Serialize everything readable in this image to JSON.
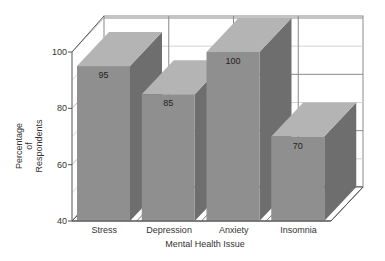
{
  "chart_data": {
    "type": "bar",
    "style": "3d",
    "title": "",
    "xlabel": "Mental Health Issue",
    "ylabel_lines": [
      "Percentage",
      "of",
      "Respondents"
    ],
    "ylabel": "Percentage of Respondents",
    "categories": [
      "Stress",
      "Depression",
      "Anxiety",
      "Insomnia"
    ],
    "values": [
      95,
      85,
      100,
      70
    ],
    "data_labels": [
      "95",
      "85",
      "100",
      "70"
    ],
    "ylim": [
      40,
      100
    ],
    "yticks": [
      40,
      60,
      80,
      100
    ],
    "ytick_labels": [
      "40",
      "60",
      "80",
      "100"
    ],
    "grid": true,
    "legend": null
  },
  "colors": {
    "bar_front": "#8f8f8f",
    "bar_top": "#b4b4b4",
    "bar_side": "#6e6e6e",
    "grid_major": "#8a8a8a",
    "grid_minor": "#d4d4d4",
    "axis": "#555555",
    "text": "#333333"
  }
}
